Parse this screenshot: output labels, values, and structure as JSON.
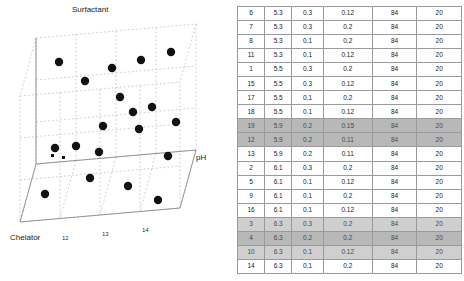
{
  "chart_data": {
    "type": "scatter",
    "title": "",
    "axes": {
      "x": {
        "label": "pH",
        "ticks": [
          "5.3",
          "5.5",
          "5.9",
          "6.1",
          "6.3"
        ]
      },
      "y": {
        "label": "Chelator",
        "ticks": [
          "0.1",
          "0.2",
          "0.3"
        ]
      },
      "z": {
        "label": "Surfactant",
        "ticks": [
          "12",
          "13",
          "14"
        ]
      }
    },
    "grid": true,
    "legend": "none",
    "points": [
      {
        "pH": 5.3,
        "chelator": 0.3,
        "surfactant": 0.12
      },
      {
        "pH": 5.3,
        "chelator": 0.3,
        "surfactant": 0.2
      },
      {
        "pH": 5.3,
        "chelator": 0.1,
        "surfactant": 0.2
      },
      {
        "pH": 5.3,
        "chelator": 0.1,
        "surfactant": 0.12
      },
      {
        "pH": 5.5,
        "chelator": 0.3,
        "surfactant": 0.2
      },
      {
        "pH": 5.5,
        "chelator": 0.3,
        "surfactant": 0.12
      },
      {
        "pH": 5.5,
        "chelator": 0.1,
        "surfactant": 0.2
      },
      {
        "pH": 5.5,
        "chelator": 0.1,
        "surfactant": 0.12
      },
      {
        "pH": 5.9,
        "chelator": 0.2,
        "surfactant": 0.15
      },
      {
        "pH": 5.9,
        "chelator": 0.2,
        "surfactant": 0.11
      },
      {
        "pH": 5.9,
        "chelator": 0.2,
        "surfactant": 0.11
      },
      {
        "pH": 6.1,
        "chelator": 0.3,
        "surfactant": 0.2
      },
      {
        "pH": 6.1,
        "chelator": 0.1,
        "surfactant": 0.12
      },
      {
        "pH": 6.1,
        "chelator": 0.1,
        "surfactant": 0.2
      },
      {
        "pH": 6.1,
        "chelator": 0.1,
        "surfactant": 0.12
      },
      {
        "pH": 6.3,
        "chelator": 0.3,
        "surfactant": 0.2
      },
      {
        "pH": 6.3,
        "chelator": 0.2,
        "surfactant": 0.2
      },
      {
        "pH": 6.3,
        "chelator": 0.1,
        "surfactant": 0.12
      },
      {
        "pH": 6.3,
        "chelator": 0.1,
        "surfactant": 0.2
      }
    ]
  },
  "plot": {
    "axis_labels": {
      "x": "pH",
      "y": "Chelator",
      "z": "Surfactant"
    },
    "x_ticks": [
      "12",
      "13",
      "14"
    ],
    "marker_color": "#111111"
  },
  "table": {
    "rows": [
      {
        "highlight": "none",
        "cells": [
          "6",
          "5.3",
          "0.3",
          "0.12",
          "84",
          "20"
        ]
      },
      {
        "highlight": "none",
        "cells": [
          "7",
          "5.3",
          "0.3",
          "0.2",
          "84",
          "20"
        ]
      },
      {
        "highlight": "none",
        "cells": [
          "8",
          "5.3",
          "0.1",
          "0.2",
          "84",
          "20"
        ]
      },
      {
        "highlight": "none",
        "cells": [
          "11",
          "5.3",
          "0.1",
          "0.12",
          "84",
          "20"
        ]
      },
      {
        "highlight": "none",
        "cells": [
          "1",
          "5.5",
          "0.3",
          "0.2",
          "84",
          "20"
        ]
      },
      {
        "highlight": "none",
        "cells": [
          "15",
          "5.5",
          "0.3",
          "0.12",
          "84",
          "20"
        ]
      },
      {
        "highlight": "none",
        "cells": [
          "17",
          "5.5",
          "0.1",
          "0.2",
          "84",
          "20"
        ]
      },
      {
        "highlight": "none",
        "cells": [
          "18",
          "5.5",
          "0.1",
          "0.12",
          "84",
          "20"
        ]
      },
      {
        "highlight": "dark",
        "cells": [
          "19",
          "5.9",
          "0.2",
          "0.15",
          "84",
          "20"
        ]
      },
      {
        "highlight": "dark",
        "cells": [
          "12",
          "5.9",
          "0.2",
          "0.11",
          "84",
          "20"
        ]
      },
      {
        "highlight": "none",
        "cells": [
          "13",
          "5.9",
          "0.2",
          "0.11",
          "84",
          "20"
        ]
      },
      {
        "highlight": "none",
        "cells": [
          "2",
          "6.1",
          "0.3",
          "0.2",
          "84",
          "20"
        ]
      },
      {
        "highlight": "none",
        "cells": [
          "5",
          "6.1",
          "0.1",
          "0.12",
          "84",
          "20"
        ]
      },
      {
        "highlight": "none",
        "cells": [
          "9",
          "6.1",
          "0.1",
          "0.2",
          "84",
          "20"
        ]
      },
      {
        "highlight": "none",
        "cells": [
          "16",
          "6.1",
          "0.1",
          "0.12",
          "84",
          "20"
        ]
      },
      {
        "highlight": "light",
        "cells": [
          "3",
          "6.3",
          "0.3",
          "0.2",
          "84",
          "20"
        ]
      },
      {
        "highlight": "dark",
        "cells": [
          "4",
          "6.3",
          "0.2",
          "0.2",
          "84",
          "20"
        ]
      },
      {
        "highlight": "light",
        "cells": [
          "10",
          "6.3",
          "0.1",
          "0.12",
          "84",
          "20"
        ]
      },
      {
        "highlight": "none",
        "cells": [
          "14",
          "6.3",
          "0.1",
          "0.2",
          "84",
          "20"
        ]
      }
    ]
  }
}
